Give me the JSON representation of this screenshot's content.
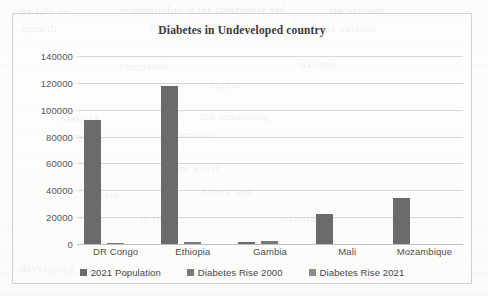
{
  "chart_data": {
    "type": "bar",
    "title": "Diabetes in Undeveloped country",
    "xlabel": "",
    "ylabel": "",
    "categories": [
      "DR Congo",
      "Ethiopia",
      "Gambia",
      "Mali",
      "Mozambique"
    ],
    "series": [
      {
        "name": "2021 Population",
        "color": "#6b6b6b",
        "values": [
          92000,
          118000,
          1500,
          22000,
          34000
        ]
      },
      {
        "name": "Diabetes Rise 2000",
        "color": "#7a7a7a",
        "values": [
          900,
          1200,
          2100,
          0,
          0
        ]
      },
      {
        "name": "Diabetes Rise 2021",
        "color": "#8d8d8d",
        "values": [
          0,
          0,
          0,
          0,
          0
        ]
      }
    ],
    "ylim": [
      0,
      140000
    ],
    "ytick_labels": [
      "0",
      "20000",
      "40000",
      "60000",
      "80000",
      "100000",
      "120000",
      "140000"
    ],
    "ytick_values": [
      0,
      20000,
      40000,
      60000,
      80000,
      100000,
      120000,
      140000
    ],
    "grid": true,
    "legend_position": "bottom"
  },
  "legend": {
    "items": [
      {
        "label": "2021 Population"
      },
      {
        "label": "Diabetes Rise 2000"
      },
      {
        "label": "Diabetes Rise 2021"
      }
    ]
  },
  "background_marks": [
    {
      "text": "the subs on",
      "x": 18,
      "y": 6,
      "size": 10,
      "rot": -0.4
    },
    {
      "text": "responsibility in the community and",
      "x": 120,
      "y": 4,
      "size": 10,
      "rot": -0.3
    },
    {
      "text": "the national",
      "x": 330,
      "y": 5,
      "size": 10,
      "rot": -0.2
    },
    {
      "text": "growth",
      "x": 22,
      "y": 22,
      "size": 11,
      "rot": 0
    },
    {
      "text": "between countries",
      "x": 150,
      "y": 20,
      "size": 11,
      "rot": 0
    },
    {
      "text": "and the various",
      "x": 300,
      "y": 22,
      "size": 11,
      "rot": 0
    },
    {
      "text": "compared",
      "x": 120,
      "y": 60,
      "size": 11,
      "rot": 0
    },
    {
      "text": "nations",
      "x": 300,
      "y": 58,
      "size": 11,
      "rot": 0
    },
    {
      "text": "higher",
      "x": 210,
      "y": 78,
      "size": 11,
      "rot": 0
    },
    {
      "text": "Malaria",
      "x": 60,
      "y": 112,
      "size": 11,
      "rot": 0
    },
    {
      "text": "the remaining",
      "x": 200,
      "y": 110,
      "size": 11,
      "rot": 0
    },
    {
      "text": "increase",
      "x": 60,
      "y": 130,
      "size": 11,
      "rot": 0
    },
    {
      "text": "countries",
      "x": 170,
      "y": 128,
      "size": 11,
      "rot": 0
    },
    {
      "text": "of the world",
      "x": 160,
      "y": 162,
      "size": 11,
      "rot": 0
    },
    {
      "text": "Africa and",
      "x": 200,
      "y": 185,
      "size": 11,
      "rot": 0
    },
    {
      "text": "rate",
      "x": 100,
      "y": 188,
      "size": 11,
      "rot": 0
    },
    {
      "text": "in the",
      "x": 140,
      "y": 212,
      "size": 11,
      "rot": 0
    },
    {
      "text": "statistics",
      "x": 280,
      "y": 212,
      "size": 11,
      "rot": 0
    },
    {
      "text": "developing",
      "x": 20,
      "y": 262,
      "size": 11,
      "rot": 0
    },
    {
      "text": "data",
      "x": 190,
      "y": 264,
      "size": 11,
      "rot": 0
    }
  ]
}
